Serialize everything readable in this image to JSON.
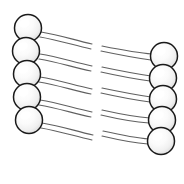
{
  "figure": {
    "title": "",
    "background_color": "#ffffff",
    "width": 184,
    "height": 184
  },
  "palette": {
    "node_outline": "#1a1a1a",
    "node_fill_light": "#ffffff",
    "node_fill_mid": "#f2f2f2",
    "node_fill_shadow": "#d4d4d4",
    "connector_stroke": "#4a4a4a",
    "background": "#ffffff"
  },
  "chart_data": {
    "type": "diagram",
    "left_column": {
      "name": "left-node-column",
      "count": 5,
      "radius": 13.5,
      "nodes": [
        {
          "id": "L1",
          "cx": 28,
          "cy": 28
        },
        {
          "id": "L2",
          "cx": 26,
          "cy": 51
        },
        {
          "id": "L3",
          "cx": 27,
          "cy": 74
        },
        {
          "id": "L4",
          "cx": 27,
          "cy": 97
        },
        {
          "id": "L5",
          "cx": 29,
          "cy": 120
        }
      ]
    },
    "right_column": {
      "name": "right-node-column",
      "count": 5,
      "radius": 13.5,
      "nodes": [
        {
          "id": "R1",
          "cx": 164,
          "cy": 56
        },
        {
          "id": "R2",
          "cx": 163,
          "cy": 78
        },
        {
          "id": "R3",
          "cx": 163,
          "cy": 99
        },
        {
          "id": "R4",
          "cx": 162,
          "cy": 120
        },
        {
          "id": "R5",
          "cx": 161,
          "cy": 141
        }
      ]
    },
    "connectors": {
      "count": 5,
      "style": "double-stroke-ribbon-with-center-gap",
      "gap_x_start": 93,
      "gap_x_end": 101,
      "links": [
        {
          "id": "C1",
          "from": "L1",
          "to": "R1"
        },
        {
          "id": "C2",
          "from": "L2",
          "to": "R2"
        },
        {
          "id": "C3",
          "from": "L3",
          "to": "R3"
        },
        {
          "id": "C4",
          "from": "L4",
          "to": "R4"
        },
        {
          "id": "C5",
          "from": "L5",
          "to": "R5"
        }
      ],
      "paths": [
        {
          "id": "C1",
          "upper_left": "M 41 32 C 60 35, 74 40, 92 44",
          "lower_left": "M 40 37 C 58 40, 73 45, 91 49",
          "upper_right": "M 102 46 C 122 50, 138 53, 152 54",
          "lower_right": "M 101 51 C 120 55, 136 58, 151 60"
        },
        {
          "id": "C2",
          "upper_left": "M 40 54 C 59 57, 73 62, 92 66",
          "lower_left": "M 39 59 C 57 62, 72 67, 91 71",
          "upper_right": "M 102 67 C 121 71, 137 74, 151 76",
          "lower_right": "M 101 72 C 119 76, 135 79, 150 81"
        },
        {
          "id": "C3",
          "upper_left": "M 40 77 C 59 80, 73 85, 92 89",
          "lower_left": "M 39 82 C 57 85, 72 90, 91 94",
          "upper_right": "M 102 88 C 121 92, 137 95, 151 97",
          "lower_right": "M 101 93 C 119 97, 135 100, 150 102"
        },
        {
          "id": "C4",
          "upper_left": "M 40 100 C 59 103, 73 108, 92 112",
          "lower_left": "M 39 105 C 57 108, 72 113, 91 117",
          "upper_right": "M 102 110 C 120 114, 136 117, 150 118",
          "lower_right": "M 101 115 C 118 119, 134 122, 149 123"
        },
        {
          "id": "C5",
          "upper_left": "M 42 123 C 61 126, 75 131, 93 135",
          "lower_left": "M 41 128 C 59 131, 74 136, 92 140",
          "upper_right": "M 103 131 C 121 135, 136 138, 149 139",
          "lower_right": "M 102 136 C 119 140, 134 143, 148 144"
        }
      ]
    }
  }
}
